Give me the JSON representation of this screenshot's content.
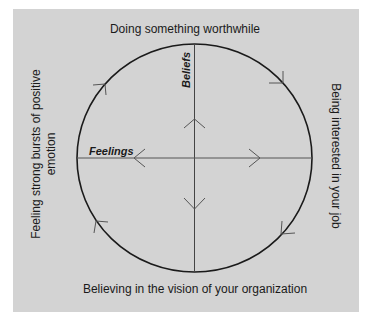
{
  "diagram": {
    "labels": {
      "top": "Doing something worthwhile",
      "right": "Being interested in your job",
      "bottom": "Believing in the vision of your organization",
      "left_line1": "Feeling strong bursts of positive",
      "left_line2": "emotion"
    },
    "axes": {
      "vertical": "Beliefs",
      "horizontal": "Feelings"
    },
    "colors": {
      "background": "#d3d3d3",
      "circle": "#1a1a1a",
      "axis": "#555555"
    },
    "flow_direction": "clockwise"
  }
}
